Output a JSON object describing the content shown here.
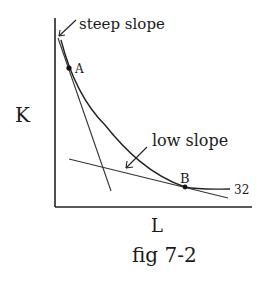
{
  "figure": {
    "caption": "fig 7-2",
    "y_axis_label": "K",
    "x_axis_label": "L",
    "curve_label": "32",
    "points": [
      {
        "id": "A",
        "label": "A"
      },
      {
        "id": "B",
        "label": "B"
      }
    ],
    "annotations": {
      "steep": "steep slope",
      "low": "low slope"
    }
  }
}
